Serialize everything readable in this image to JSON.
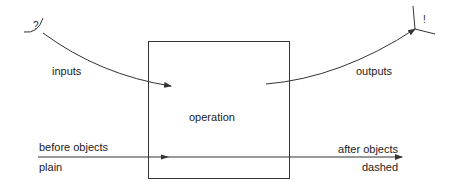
{
  "diagram": {
    "box_label": "operation",
    "start_symbol": "?",
    "end_symbol": "!",
    "inputs_label": "inputs",
    "outputs_label": "outputs",
    "before_label": "before objects",
    "before_style": "plain",
    "after_label": "after objects",
    "after_style": "dashed",
    "colors": {
      "line": "#333333",
      "text": "#222222",
      "background": "#ffffff"
    }
  }
}
